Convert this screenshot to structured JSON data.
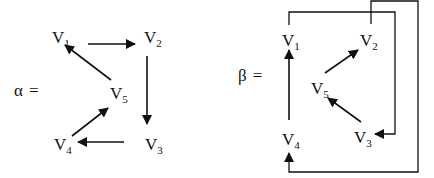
{
  "diagrams": [
    {
      "id": "alpha",
      "name_symbol": "α",
      "equals": "=",
      "nodes": [
        {
          "id": "V1",
          "letter": "V",
          "sub": "1"
        },
        {
          "id": "V2",
          "letter": "V",
          "sub": "2"
        },
        {
          "id": "V3",
          "letter": "V",
          "sub": "3"
        },
        {
          "id": "V4",
          "letter": "V",
          "sub": "4"
        },
        {
          "id": "V5",
          "letter": "V",
          "sub": "5"
        }
      ],
      "edges": [
        {
          "from": "V1",
          "to": "V2"
        },
        {
          "from": "V2",
          "to": "V3"
        },
        {
          "from": "V3",
          "to": "V4"
        },
        {
          "from": "V4",
          "to": "V5"
        },
        {
          "from": "V5",
          "to": "V1"
        }
      ]
    },
    {
      "id": "beta",
      "name_symbol": "β",
      "equals": "=",
      "nodes": [
        {
          "id": "V1",
          "letter": "V",
          "sub": "1"
        },
        {
          "id": "V2",
          "letter": "V",
          "sub": "2"
        },
        {
          "id": "V3",
          "letter": "V",
          "sub": "3"
        },
        {
          "id": "V4",
          "letter": "V",
          "sub": "4"
        },
        {
          "id": "V5",
          "letter": "V",
          "sub": "5"
        }
      ],
      "edges": [
        {
          "from": "V1",
          "to": "V3",
          "route": "outer-loop-right"
        },
        {
          "from": "V2",
          "to": "V4",
          "route": "outer-loop-around"
        },
        {
          "from": "V4",
          "to": "V1"
        },
        {
          "from": "V5",
          "to": "V2"
        },
        {
          "from": "V3",
          "to": "V5"
        }
      ]
    }
  ],
  "colors": {
    "ink": "#111111",
    "background": "#ffffff"
  }
}
